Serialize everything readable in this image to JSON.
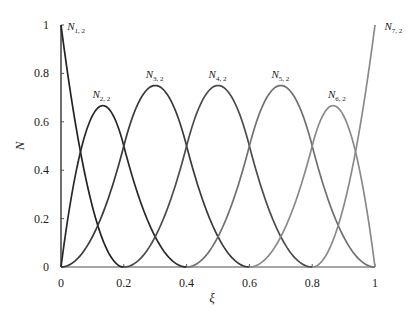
{
  "chart_data": {
    "type": "line",
    "title": "",
    "xlabel": "ξ",
    "ylabel": "N",
    "xlim": [
      0,
      1
    ],
    "ylim": [
      0,
      1
    ],
    "grid": false,
    "legend": "inline labels near curves",
    "x_ticks": [
      "0",
      "0.2",
      "0.4",
      "0.6",
      "0.8",
      "1"
    ],
    "y_ticks": [
      "0",
      "0.2",
      "0.4",
      "0.6",
      "0.8",
      "1"
    ],
    "knot_vector": [
      0,
      0,
      0,
      0.2,
      0.4,
      0.6,
      0.8,
      1,
      1,
      1
    ],
    "degree": 2,
    "series": [
      {
        "name": "N1,2",
        "label_main": "N",
        "label_sub": "1, 2",
        "color": "#222222",
        "peak_x": 0.0,
        "peak_y": 1.0,
        "support": [
          0,
          0.2
        ],
        "label_pos": [
          0.02,
          0.98
        ]
      },
      {
        "name": "N2,2",
        "label_main": "N",
        "label_sub": "2, 2",
        "color": "#2a2a2a",
        "peak_x": 0.133,
        "peak_y": 0.667,
        "support": [
          0,
          0.4
        ],
        "label_pos": [
          0.1,
          0.7
        ]
      },
      {
        "name": "N3,2",
        "label_main": "N",
        "label_sub": "3, 2",
        "color": "#3a3a3a",
        "peak_x": 0.3,
        "peak_y": 0.75,
        "support": [
          0,
          0.6
        ],
        "label_pos": [
          0.27,
          0.78
        ]
      },
      {
        "name": "N4,2",
        "label_main": "N",
        "label_sub": "4, 2",
        "color": "#4c4c4c",
        "peak_x": 0.5,
        "peak_y": 0.75,
        "support": [
          0.2,
          0.8
        ],
        "label_pos": [
          0.47,
          0.78
        ]
      },
      {
        "name": "N5,2",
        "label_main": "N",
        "label_sub": "5, 2",
        "color": "#707070",
        "peak_x": 0.7,
        "peak_y": 0.75,
        "support": [
          0.4,
          1.0
        ],
        "label_pos": [
          0.67,
          0.78
        ]
      },
      {
        "name": "N6,2",
        "label_main": "N",
        "label_sub": "6, 2",
        "color": "#8a8a8a",
        "peak_x": 0.867,
        "peak_y": 0.667,
        "support": [
          0.6,
          1.0
        ],
        "label_pos": [
          0.85,
          0.7
        ]
      },
      {
        "name": "N7,2",
        "label_main": "N",
        "label_sub": "7, 2",
        "color": "#8a8a8a",
        "peak_x": 1.0,
        "peak_y": 1.0,
        "support": [
          0.8,
          1.0
        ],
        "label_pos": [
          1.03,
          0.98
        ]
      }
    ]
  },
  "layout": {
    "origin_px": [
      61,
      267
    ],
    "x1_px": 375,
    "y1_px": 25
  }
}
